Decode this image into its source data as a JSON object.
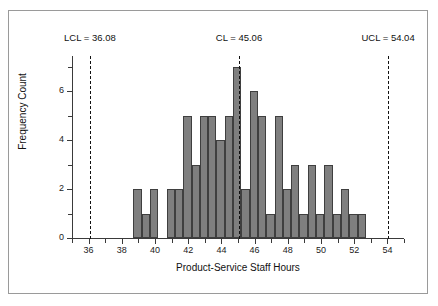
{
  "chart_data": {
    "type": "bar",
    "title": "",
    "xlabel": "Product-Service Staff Hours",
    "ylabel": "Frequency Count",
    "xlim": [
      35,
      55
    ],
    "ylim": [
      0,
      7.45
    ],
    "grid": false,
    "legend": null,
    "bin_width": 0.5,
    "bin_starts": [
      38.7,
      39.2,
      39.7,
      40.7,
      41.2,
      41.7,
      42.2,
      42.7,
      43.2,
      43.7,
      44.2,
      44.7,
      45.2,
      45.7,
      46.2,
      46.7,
      47.2,
      47.7,
      48.2,
      48.7,
      49.2,
      49.7,
      50.2,
      50.7,
      51.2,
      51.7,
      52.2
    ],
    "categories": [
      "38.7",
      "39.2",
      "39.7",
      "40.7",
      "41.2",
      "41.7",
      "42.2",
      "42.7",
      "43.2",
      "43.7",
      "44.2",
      "44.7",
      "45.2",
      "45.7",
      "46.2",
      "46.7",
      "47.2",
      "47.7",
      "48.2",
      "48.7",
      "49.2",
      "49.7",
      "50.2",
      "50.7",
      "51.2",
      "51.7",
      "52.2"
    ],
    "values": [
      2,
      1,
      2,
      2,
      2,
      5,
      3,
      5,
      5,
      4,
      5,
      7,
      2,
      6,
      5,
      1,
      5,
      2,
      3,
      1,
      3,
      1,
      3,
      1,
      2,
      1,
      1
    ],
    "xticks": [
      36,
      38,
      40,
      42,
      44,
      46,
      48,
      50,
      52,
      54
    ],
    "xtick_labels": [
      "36",
      "38",
      "40",
      "42",
      "44",
      "46",
      "48",
      "50",
      "52",
      "54"
    ],
    "xminor_ticks": [
      35,
      37,
      39,
      41,
      43,
      45,
      47,
      49,
      51,
      53,
      55
    ],
    "yticks": [
      0,
      2,
      4,
      6
    ],
    "ytick_labels": [
      "0",
      "2",
      "4",
      "6"
    ],
    "yminor_ticks": [
      1,
      3,
      5,
      7
    ],
    "annotations": [
      {
        "name": "lcl",
        "label": "LCL = 36.08",
        "value": 36.08
      },
      {
        "name": "cl",
        "label": "CL = 45.06",
        "value": 45.06
      },
      {
        "name": "ucl",
        "label": "UCL = 54.04",
        "value": 54.04
      }
    ],
    "colors": {
      "bar_fill": "#7f7f7f",
      "bar_edge": "#3f3f3f",
      "axis": "#3a3a3a",
      "control_line": "#111111",
      "frame": "#9a9a9a",
      "background": "#ffffff"
    }
  }
}
